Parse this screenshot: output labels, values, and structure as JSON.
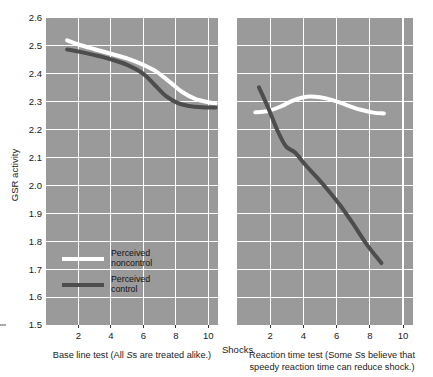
{
  "chart_data": {
    "type": "line",
    "title": "",
    "ylabel": "GSR activity",
    "xlabel": "Shocks",
    "ylim": [
      1.5,
      2.6
    ],
    "xlim": [
      0,
      10.6
    ],
    "grid": true,
    "legend_position": "inside-lower-left-of-left-panel",
    "ytick_labels": [
      "2.6",
      "2.5",
      "2.4",
      "2.3",
      "2.2",
      "2.1",
      "2.0",
      "1.9",
      "1.8",
      "1.7",
      "1.6",
      "1.5"
    ],
    "ytick_values": [
      2.6,
      2.5,
      2.4,
      2.3,
      2.2,
      2.1,
      2.0,
      1.9,
      1.8,
      1.7,
      1.6,
      1.5
    ],
    "xtick_labels": [
      "2",
      "4",
      "6",
      "8",
      "10"
    ],
    "xtick_values": [
      2,
      4,
      6,
      8,
      10
    ],
    "legend": [
      {
        "name": "Perceived noncontrol",
        "line1": "Perceived",
        "line2": "noncontrol",
        "color": "#ffffff"
      },
      {
        "name": "Perceived control",
        "line1": "Perceived",
        "line2": "control",
        "color": "#4d4d4d"
      }
    ],
    "panels": [
      {
        "id": "baseline",
        "caption_line1": "Base line test (All ",
        "caption_italic": "S",
        "caption_line1b": "s are treated alike.)",
        "caption_full": "Base line test (All Ss are treated alike.)",
        "series": [
          {
            "name": "Perceived noncontrol",
            "color": "#ffffff",
            "x": [
              1.3,
              2.0,
              3.0,
              4.0,
              5.0,
              6.0,
              6.8,
              7.6,
              8.4,
              9.2,
              10.0,
              10.45
            ],
            "y": [
              2.52,
              2.505,
              2.488,
              2.472,
              2.455,
              2.432,
              2.408,
              2.372,
              2.335,
              2.31,
              2.298,
              2.294
            ]
          },
          {
            "name": "Perceived control",
            "color": "#4d4d4d",
            "x": [
              1.3,
              2.0,
              3.0,
              4.0,
              5.0,
              6.0,
              6.7,
              7.4,
              8.1,
              8.8,
              9.6,
              10.45
            ],
            "y": [
              2.487,
              2.48,
              2.467,
              2.452,
              2.432,
              2.4,
              2.36,
              2.32,
              2.296,
              2.285,
              2.28,
              2.279
            ]
          }
        ]
      },
      {
        "id": "reaction-time",
        "caption_line1": "Reaction time test (Some ",
        "caption_italic": "S",
        "caption_line1b": "s believe that",
        "caption_line2": "speedy reaction time can reduce shock.)",
        "caption_full": "Reaction time test (Some Ss believe that speedy reaction time can reduce shock.)",
        "series": [
          {
            "name": "Perceived noncontrol",
            "color": "#ffffff",
            "x": [
              1.1,
              1.8,
              2.6,
              3.4,
              4.2,
              5.0,
              5.8,
              6.6,
              7.4,
              8.2,
              8.85
            ],
            "y": [
              2.262,
              2.266,
              2.282,
              2.305,
              2.318,
              2.316,
              2.305,
              2.288,
              2.272,
              2.261,
              2.258
            ]
          },
          {
            "name": "Perceived control",
            "color": "#4d4d4d",
            "x": [
              1.32,
              1.9,
              2.45,
              2.95,
              3.5,
              4.1,
              4.8,
              5.5,
              6.2,
              7.0,
              7.8,
              8.7
            ],
            "y": [
              2.352,
              2.275,
              2.195,
              2.14,
              2.118,
              2.075,
              2.03,
              1.982,
              1.93,
              1.862,
              1.79,
              1.722
            ]
          }
        ]
      }
    ]
  },
  "colors": {
    "plot_background": "#9a9a9a",
    "gridline": "#ffffff",
    "noncontrol_line": "#ffffff",
    "control_line": "#4d4d4d",
    "page_background": "#ffffff",
    "text": "#1a1a1a"
  }
}
